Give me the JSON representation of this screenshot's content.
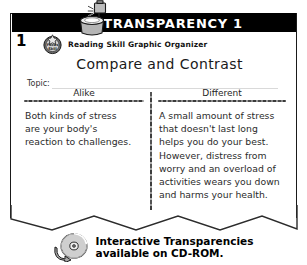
{
  "header": {
    "title": "TRANSPARENCY 1",
    "bar_color": "#000000",
    "text_color": "#ffffff",
    "projector_icon": "overhead-projector-icon"
  },
  "lesson": {
    "number": "1",
    "badge_icon": "focus-skill-badge-icon",
    "badge_text_top": "Focus",
    "badge_text_bottom": "Skill",
    "skill_label": "Reading Skill Graphic Organizer"
  },
  "organizer": {
    "title": "Compare and Contrast",
    "topic_label": "Topic:",
    "topic_value": "",
    "columns": [
      {
        "heading": "Alike",
        "lines": [
          "Both kinds of stress",
          "are your body's",
          "reaction to challenges."
        ]
      },
      {
        "heading": "Different",
        "lines": [
          "A small amount of stress",
          "that doesn't last long",
          "helps you do your best.",
          "However, distress from",
          "worry and an overload of",
          "activities wears you down",
          "and harms your health."
        ]
      }
    ]
  },
  "footer": {
    "icon": "cd-rom-icon",
    "line1": "Interactive Transparencies",
    "line2": "available on CD-ROM."
  }
}
